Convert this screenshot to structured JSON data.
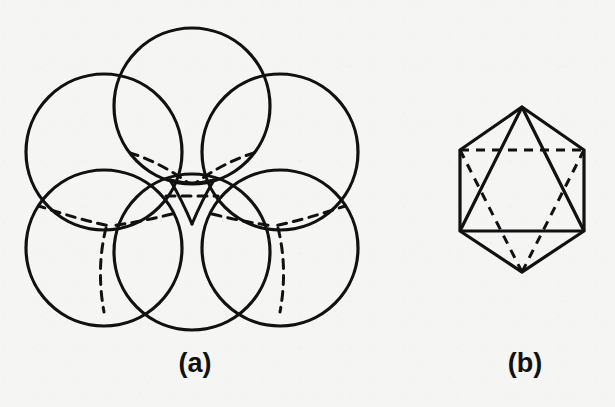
{
  "figure": {
    "background_color": "#f5f5f4",
    "ink_color": "#111111",
    "width": 615,
    "height": 407,
    "panels": [
      {
        "id": "a",
        "caption": "(a)",
        "title": "close-packed sphere cluster"
      },
      {
        "id": "b",
        "caption": "(b)",
        "title": "octahedron"
      }
    ]
  },
  "chart_data": {
    "type": "diagram",
    "panel_a": {
      "caption": "(a)",
      "description": "Six mutually touching spheres drawn as circles in hexagonal close packing, with hidden tetrahedral bond directions shown dashed and a small curvilinear triangular void at the centre.",
      "stroke_width_solid": 3.0,
      "stroke_width_dashed": 3.0,
      "dash_pattern": "9 7",
      "circle_radius": 78,
      "circles": [
        {
          "name": "top",
          "cx": 192,
          "cy": 106
        },
        {
          "name": "upper-left",
          "cx": 104,
          "cy": 152
        },
        {
          "name": "upper-right",
          "cx": 280,
          "cy": 152
        },
        {
          "name": "lower-left",
          "cx": 104,
          "cy": 248
        },
        {
          "name": "lower-right",
          "cx": 280,
          "cy": 248
        },
        {
          "name": "bottom",
          "cx": 192,
          "cy": 252
        }
      ],
      "void_center": {
        "x": 192,
        "y": 186
      }
    },
    "panel_b": {
      "caption": "(b)",
      "description": "Octahedron drawn in projection as a regular hexagon containing a solid upward-pointing triangle (front faces) and a dashed downward-pointing triangle (hidden rear edges).",
      "stroke_width_solid": 3.0,
      "stroke_width_dashed": 3.0,
      "dash_pattern": "9 8",
      "hexagon_vertices": [
        {
          "name": "top",
          "x": 522,
          "y": 107
        },
        {
          "name": "upper-right",
          "x": 584,
          "y": 150
        },
        {
          "name": "lower-right",
          "x": 584,
          "y": 231
        },
        {
          "name": "bottom",
          "x": 522,
          "y": 272
        },
        {
          "name": "lower-left",
          "x": 460,
          "y": 231
        },
        {
          "name": "upper-left",
          "x": 460,
          "y": 150
        }
      ],
      "solid_triangle": [
        "top",
        "lower-left",
        "lower-right"
      ],
      "dashed_triangle": [
        "bottom",
        "upper-left",
        "upper-right"
      ]
    }
  }
}
